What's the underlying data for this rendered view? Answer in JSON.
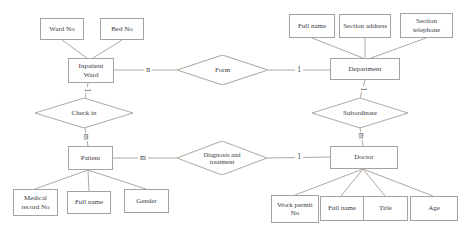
{
  "colors": {
    "background": "#ffffff",
    "line": "#b0a79e",
    "box_border": "#a3a3a3",
    "text": "#3b3b44"
  },
  "diagram": {
    "type": "entity-relationship",
    "entities": {
      "inpatient_ward": "Inpatient Ward",
      "department": "Department",
      "patient": "Patient",
      "doctor": "Doctor"
    },
    "relationships": {
      "form": "Form",
      "check_in": "Check in",
      "subordinate": "Subordinate",
      "diagnosis": "Diagnosis and treatment"
    },
    "attributes": {
      "ward_no": "Ward No",
      "bed_no": "Bed No",
      "dept_full_name": "Full name",
      "section_address": "Section address",
      "section_telephone": "Section telephone",
      "medical_record_no": "Medical record No",
      "patient_full_name": "Full name",
      "gender": "Gender",
      "work_permit_no": "Work permit No",
      "doctor_full_name": "Full name",
      "title": "Title",
      "age": "Age"
    },
    "cardinalities": {
      "ward_form": "n",
      "form_department": "1",
      "ward_check_in": "1",
      "check_in_patient": "m",
      "patient_diagnosis": "m",
      "diagnosis_doctor": "1",
      "department_subordinate": "1",
      "subordinate_doctor": "m"
    }
  }
}
